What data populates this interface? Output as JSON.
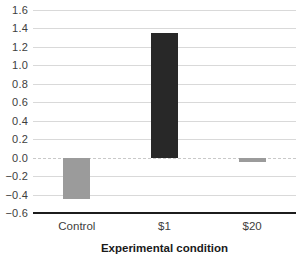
{
  "chart_data": {
    "type": "bar",
    "title": "",
    "xlabel": "Experimental condition",
    "ylabel": "",
    "categories": [
      "Control",
      "$1",
      "$20"
    ],
    "values": [
      -0.45,
      1.35,
      -0.05
    ],
    "bar_colors": [
      "#9b9b9b",
      "#282828",
      "#9b9b9b"
    ],
    "ylim": [
      -0.6,
      1.6
    ],
    "ytick_values": [
      1.6,
      1.4,
      1.2,
      1.0,
      0.8,
      0.6,
      0.4,
      0.2,
      0.0,
      -0.2,
      -0.4,
      -0.6
    ],
    "ytick_labels": [
      "1.6",
      "1.4",
      "1.2",
      "1.0",
      "0.8",
      "0.6",
      "0.4",
      "0.2",
      "0.0",
      "−0.2",
      "−0.4",
      "−0.6"
    ],
    "grid": true,
    "zero_line_style": "dashed",
    "legend": "none"
  },
  "style": {
    "background": "#ffffff",
    "grid_color": "#d9d9d9",
    "zero_line_color": "#c9c9c9",
    "axis_line_color": "#1c1c1c",
    "tick_text_color": "#3d3d3d",
    "title_text_color": "#1a1a1a"
  }
}
